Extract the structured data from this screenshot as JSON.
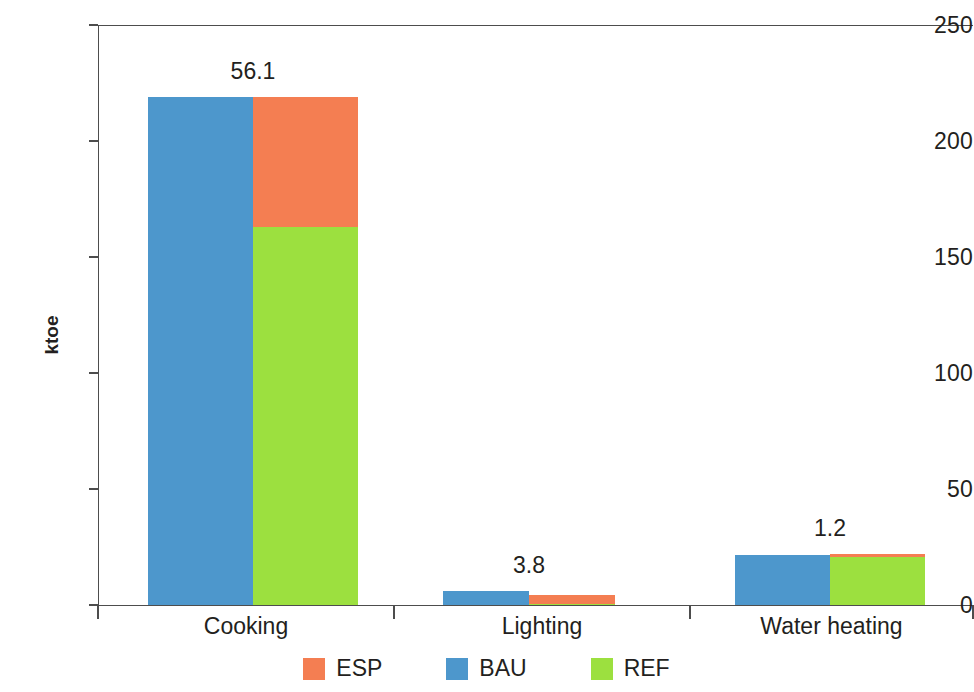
{
  "chart_data": {
    "type": "bar",
    "title": "",
    "subtitle": "",
    "xlabel": "",
    "ylabel": "ktoe",
    "ylim": [
      0,
      250
    ],
    "yticks": [
      0,
      50,
      100,
      150,
      200,
      250
    ],
    "ytick_labels": [
      "0",
      "50",
      "100",
      "150",
      "200",
      "250"
    ],
    "grid": false,
    "legend_position": "bottom",
    "categories": [
      "Cooking",
      "Lighting",
      "Water heating"
    ],
    "series": [
      {
        "name": "BAU",
        "color": "#4d97cc",
        "values": [
          219.0,
          6.2,
          21.6
        ]
      },
      {
        "name": "REF",
        "color": "#9ce03f",
        "values": [
          163.0,
          0.6,
          20.8
        ]
      },
      {
        "name": "ESP",
        "color": "#f47e52",
        "values": [
          219.1,
          4.4,
          22.0
        ]
      }
    ],
    "data_labels": [
      "56.1",
      "3.8",
      "1.2"
    ],
    "data_label_note": "difference between ESP and REF stacks",
    "colors": {
      "esp": "#f47e52",
      "bau": "#4d97cc",
      "ref": "#9ce03f",
      "axis": "#4d4d4d",
      "text": "#231f20",
      "background": "#ffffff"
    }
  },
  "legend": {
    "items": [
      {
        "label": "ESP",
        "color": "#f47e52"
      },
      {
        "label": "BAU",
        "color": "#4d97cc"
      },
      {
        "label": "REF",
        "color": "#9ce03f"
      }
    ]
  }
}
